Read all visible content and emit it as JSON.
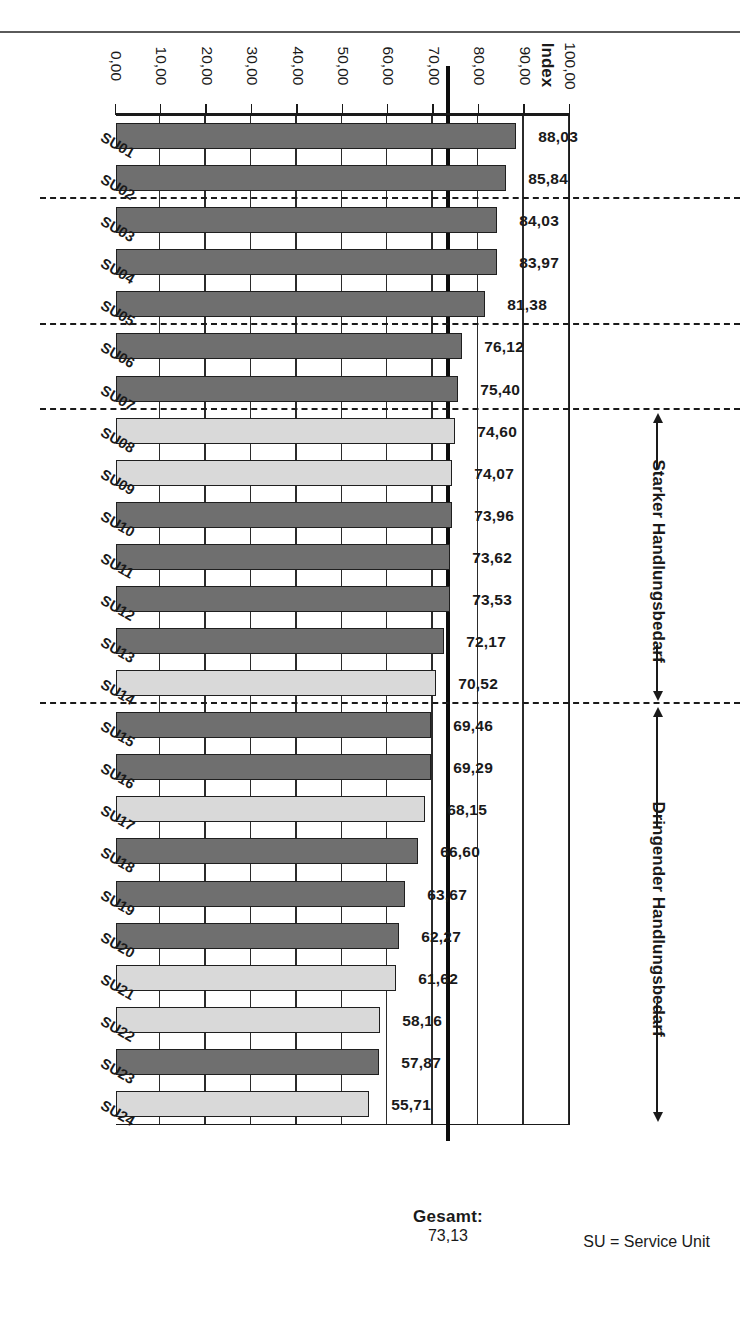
{
  "chart_data": {
    "type": "bar",
    "orientation": "horizontal",
    "title": "",
    "xlabel": "Index",
    "ylabel": "",
    "axis_title": "Index",
    "categories": [
      "SU01",
      "SU02",
      "SU03",
      "SU04",
      "SU05",
      "SU06",
      "SU07",
      "SU08",
      "SU09",
      "SU10",
      "SU11",
      "SU12",
      "SU13",
      "SU14",
      "SU15",
      "SU16",
      "SU17",
      "SU18",
      "SU19",
      "SU20",
      "SU21",
      "SU22",
      "SU23",
      "SU24"
    ],
    "values": [
      88.03,
      85.84,
      84.03,
      83.97,
      81.38,
      76.12,
      75.4,
      74.6,
      74.07,
      73.96,
      73.62,
      73.53,
      72.17,
      70.52,
      69.46,
      69.29,
      68.15,
      66.6,
      63.67,
      62.27,
      61.62,
      58.16,
      57.87,
      55.71
    ],
    "value_labels": [
      "88,03",
      "85,84",
      "84,03",
      "83,97",
      "81,38",
      "76,12",
      "75,40",
      "74,60",
      "74,07",
      "73,96",
      "73,62",
      "73,53",
      "72,17",
      "70,52",
      "69,46",
      "69,29",
      "68,15",
      "66,60",
      "63,67",
      "62,27",
      "61,62",
      "58,16",
      "57,87",
      "55,71"
    ],
    "bar_shades": [
      "dark",
      "dark",
      "dark",
      "dark",
      "dark",
      "dark",
      "dark",
      "light",
      "light",
      "dark",
      "dark",
      "dark",
      "dark",
      "light",
      "dark",
      "dark",
      "light",
      "dark",
      "dark",
      "dark",
      "light",
      "light",
      "dark",
      "light"
    ],
    "ylim": [
      0,
      100
    ],
    "tick_labels": [
      "100,00",
      "90,00",
      "80,00",
      "70,00",
      "60,00",
      "50,00",
      "40,00",
      "30,00",
      "20,00",
      "10,00",
      "0,00"
    ],
    "tick_values": [
      100,
      90,
      80,
      70,
      60,
      50,
      40,
      30,
      20,
      10,
      0
    ],
    "grid": true,
    "legend": "none",
    "reference_line": {
      "label": "Gesamt:",
      "value_label": "73,13",
      "value": 73.13
    },
    "separators": [
      {
        "after_category": "SU02",
        "position": 2
      },
      {
        "after_category": "SU05",
        "position": 5
      },
      {
        "after_category": "SU07",
        "position": 7
      },
      {
        "after_category": "SU14",
        "position": 14
      }
    ],
    "annotations": [
      {
        "label": "Starker Handlungsbedarf",
        "from_category": "SU08",
        "to_category": "SU14"
      },
      {
        "label": "Dringender Handlungsbedarf",
        "from_category": "SU15",
        "to_category": "SU24"
      }
    ],
    "footnote": "SU = Service Unit",
    "colors": {
      "bar_dark": "#6f6f6f",
      "bar_light": "#d9d9d9",
      "bar_border": "#1f1f1f",
      "axis": "#1a1a1a",
      "grid": "#2b2b2b",
      "reference_line": "#0d0d0d"
    }
  }
}
